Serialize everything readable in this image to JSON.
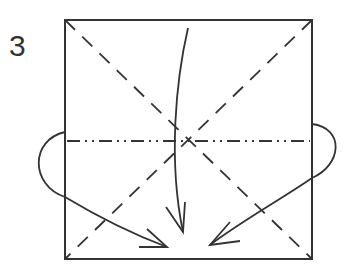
{
  "step": {
    "number": "3"
  },
  "diagram": {
    "type": "origami-fold-diagram",
    "square": {
      "x1": 65,
      "y1": 20,
      "x2": 312,
      "y2": 259
    },
    "lines": [
      {
        "name": "valley-fold-diagonal-1",
        "style": "dashed",
        "from": [
          65,
          20
        ],
        "to": [
          312,
          259
        ]
      },
      {
        "name": "valley-fold-diagonal-2",
        "style": "dashed",
        "from": [
          312,
          20
        ],
        "to": [
          65,
          259
        ]
      },
      {
        "name": "mountain-fold-horizontal",
        "style": "dash-dot-dot",
        "from": [
          65,
          141
        ],
        "to": [
          312,
          141
        ]
      }
    ],
    "arrows": [
      {
        "name": "center-fold-arrow",
        "direction": "down"
      },
      {
        "name": "left-fold-arrow",
        "direction": "wrap-left-to-center"
      },
      {
        "name": "right-fold-arrow",
        "direction": "wrap-right-to-center"
      }
    ],
    "colors": {
      "stroke": "#333333",
      "background": "#ffffff"
    }
  }
}
